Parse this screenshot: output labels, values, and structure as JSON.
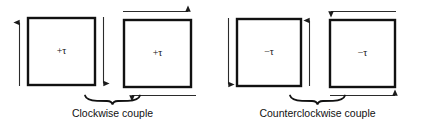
{
  "figure": {
    "background_color": "#ffffff",
    "line_color": "#111111",
    "arrow_color": "#2b2b2b",
    "width": 422,
    "height": 132
  },
  "blocks": [
    {
      "id": "block-1",
      "torque_label": "+τ",
      "sense": "clockwise",
      "group": "clockwise",
      "force_arrows": [
        {
          "name": "left-force-arrow-up",
          "side": "left",
          "direction": "up"
        },
        {
          "name": "right-force-arrow-down",
          "side": "right",
          "direction": "down"
        }
      ]
    },
    {
      "id": "block-2",
      "torque_label": "+τ",
      "sense": "clockwise",
      "group": "clockwise",
      "force_arrows": [
        {
          "name": "top-force-arrow-right",
          "side": "top",
          "direction": "right"
        },
        {
          "name": "bottom-force-arrow-left",
          "side": "bottom",
          "direction": "left"
        }
      ]
    },
    {
      "id": "block-3",
      "torque_label": "−τ",
      "sense": "counterclockwise",
      "group": "counterclockwise",
      "force_arrows": [
        {
          "name": "left-force-arrow-down",
          "side": "left",
          "direction": "down"
        },
        {
          "name": "right-force-arrow-up",
          "side": "right",
          "direction": "up"
        }
      ]
    },
    {
      "id": "block-4",
      "torque_label": "−τ",
      "sense": "counterclockwise",
      "group": "counterclockwise",
      "force_arrows": [
        {
          "name": "top-force-arrow-left",
          "side": "top",
          "direction": "left"
        },
        {
          "name": "bottom-force-arrow-right",
          "side": "bottom",
          "direction": "right"
        }
      ]
    }
  ],
  "captions": {
    "clockwise": "Clockwise couple",
    "counterclockwise": "Counterclockwise couple"
  }
}
